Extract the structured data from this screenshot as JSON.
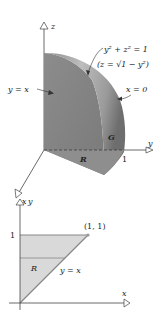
{
  "figure_3d": {
    "axis_labels": {
      "z": "z",
      "y": "y",
      "x": "x"
    },
    "surface_label": "y² + z² = 1",
    "surface_explicit": "(z = √1 − y²)",
    "plane_label_left": "y = x",
    "plane_label_right": "x = 0",
    "solid_label": "G",
    "region_label": "R",
    "y_tick": "1"
  },
  "figure_2d": {
    "axis_labels": {
      "y": "y",
      "x": "x"
    },
    "y_tick": "1",
    "point_label": "(1, 1)",
    "line_label": "y = x",
    "region_label": "R"
  },
  "colors": {
    "solid_dark": "#7d7d7d",
    "solid_mid": "#a3a3a3",
    "solid_light": "#c8c8c8",
    "region_fill": "#d9d9d9",
    "axis": "#444444"
  }
}
